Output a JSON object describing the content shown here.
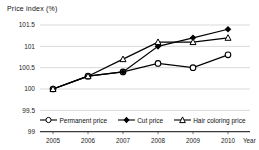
{
  "title": "Price index (%)",
  "colors": {
    "line": "#000000",
    "grid": "#c9c9c9",
    "axis": "#3a3a3a",
    "text": "#222222",
    "background": "#ffffff"
  },
  "legend": {
    "items": [
      {
        "label": "Permanent price",
        "marker": "open-circle"
      },
      {
        "label": "Cut price",
        "marker": "filled-diamond"
      },
      {
        "label": "Hair coloring price",
        "marker": "open-triangle"
      }
    ]
  },
  "chart_data": {
    "type": "line",
    "title": "Price index (%)",
    "xlabel": "Year",
    "ylabel": "Price index (%)",
    "x": [
      2005,
      2006,
      2007,
      2008,
      2009,
      2010
    ],
    "yticks": [
      99,
      99.5,
      100,
      100.5,
      101,
      101.5
    ],
    "ylim": [
      99,
      101.5
    ],
    "grid": true,
    "legend_position": "bottom-inside",
    "series": [
      {
        "name": "Permanent price",
        "marker": "open-circle",
        "values": [
          100.0,
          100.3,
          100.4,
          100.6,
          100.5,
          100.8
        ]
      },
      {
        "name": "Cut price",
        "marker": "filled-diamond",
        "values": [
          100.0,
          100.3,
          100.4,
          101.0,
          101.2,
          101.4
        ]
      },
      {
        "name": "Hair coloring price",
        "marker": "open-triangle",
        "values": [
          100.0,
          100.3,
          100.7,
          101.1,
          101.1,
          101.2
        ]
      }
    ]
  }
}
